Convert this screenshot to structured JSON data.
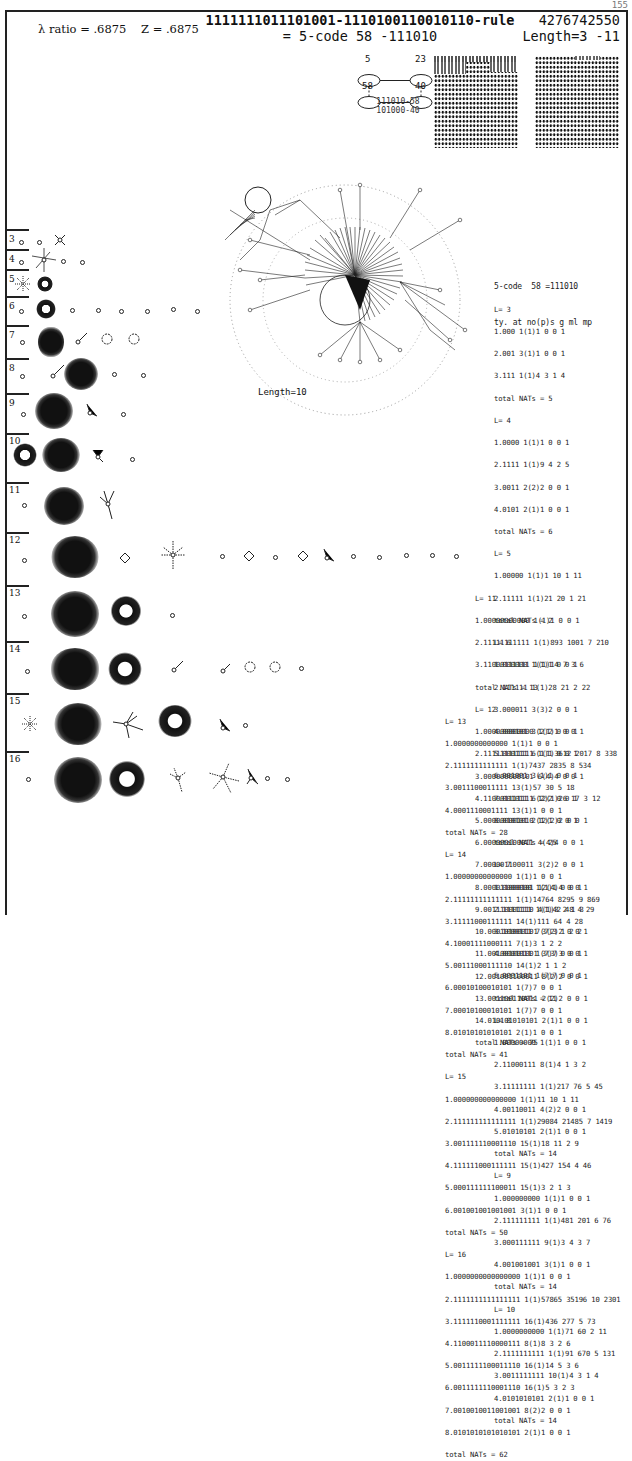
{
  "page_number": "155",
  "header": {
    "lambda_label": "λ ratio = .6875",
    "z_label": "Z = .6875",
    "rule_line": "1111111011101001-1110100110010110-rule",
    "code_line": "= 5-code  58 -111010",
    "rule_number": "4276742550",
    "length_range": "Length=3 -11"
  },
  "cycle_diagram": {
    "nodes": [
      "5",
      "23",
      "58",
      "40"
    ],
    "caption": [
      "111010-58",
      "101000-40"
    ]
  },
  "big_graph_label": "Length=10",
  "rows": [
    {
      "label": "3"
    },
    {
      "label": "4"
    },
    {
      "label": "5"
    },
    {
      "label": "6"
    },
    {
      "label": "7"
    },
    {
      "label": "8"
    },
    {
      "label": "9"
    },
    {
      "label": "10"
    },
    {
      "label": "11"
    },
    {
      "label": "12"
    },
    {
      "label": "13"
    },
    {
      "label": "14"
    },
    {
      "label": "15"
    },
    {
      "label": "16"
    }
  ],
  "stats": {
    "title": "5-code  58 =111010",
    "columns": "ty. at no(p)s g ml mp",
    "blocks": [
      {
        "L": "L= 3",
        "lines": [
          "1.000 1(1)1 0 0 1",
          "2.001 3(1)1 0 0 1",
          "3.111 1(1)4 3 1 4"
        ],
        "total": "total NATs = 5"
      },
      {
        "L": "L= 4",
        "lines": [
          "1.0000 1(1)1 0 0 1",
          "2.1111 1(1)9 4 2 5",
          "3.0011 2(2)2 0 0 1",
          "4.0101 2(1)1 0 0 1"
        ],
        "total": "total NATs = 6"
      },
      {
        "L": "L= 5",
        "lines": [
          "1.00000 1(1)1 10 1 11",
          "2.11111 1(1)21 20 1 21"
        ],
        "total": "total NATs = 2"
      },
      {
        "L": "L= 6",
        "lines": [
          "1.000000 1(1)1 0 0 1",
          "2.111111 1(1)28 21 2 22",
          "3.000011 3(3)2 0 0 1",
          "4.000101 3(2)2 0 0 1",
          "5.000111 6(1)1 0 0 1",
          "6.001001 3(1)1 0 0 1",
          "7.001011 6(2)2 0 0 1",
          "8.010101 2(1)1 0 0 1"
        ],
        "total": "total NATs = 25"
      },
      {
        "L": "L= 7",
        "lines": [
          "1.0000000 1(1)1 0 0 1",
          "2.1111111 1(1)42 48 4 29",
          "3.1000111 7(7)3 1 2 2",
          "4.0001011 1(7)7 0 0 1",
          "5.0001101 1(7)7 0 0 1"
        ],
        "total": "total NATs = 11"
      },
      {
        "L": "L= 8",
        "lines": [
          "1.00000000 1(1)1 0 0 1",
          "2.11000111 8(1)4 1 3 2",
          "3.11111111 1(1)217 76 5 45",
          "4.00110011 4(2)2 0 0 1",
          "5.01010101 2(1)1 0 0 1"
        ],
        "total": "total NATs = 14"
      },
      {
        "L": "L= 9",
        "lines": [
          "1.000000000 1(1)1 0 0 1",
          "2.111111111 1(1)481 201 6 76",
          "3.000111111 9(1)3 4 3 7",
          "4.001001001 3(1)1 0 0 1"
        ],
        "total": "total NATs = 14"
      },
      {
        "L": "L= 10",
        "lines": [
          "1.0000000000 1(1)71 60 2 11",
          "2.1111111111 1(1)91 670 5 131",
          "3.0011111111 10(1)4 3 1 4",
          "4.0101010101 2(1)1 0 0 1"
        ],
        "total": "total NATs = 14"
      },
      {
        "L": "L= 11",
        "lines": [
          "1.00000000000 1(1)1 0 0 1",
          "2.11111111111 1(1)893 1001 7 210",
          "3.11000111111 1(1)14 7 3 6"
        ],
        "total": "total NATs = 13"
      },
      {
        "L": "L= 12",
        "lines": [
          "1.000000000000 1(1)1 0 0 1",
          "2.111111111111 1(1)3612 2017 8 338",
          "3.000000000101 6(4)4 0 0 1",
          "4.110001111111 12(1)26 17 3 12",
          "5.000000001010 12(2)2 0 0 1",
          "6.000000100011 4(4)4 0 0 1",
          "7.000001100011 3(2)2 0 0 1",
          "8.000011000101 12(4)4 0 0 1",
          "9.001110001110 4(1)3 2 1 3",
          "10.000101000101 3(2)2 0 0 1",
          "11.001001001001 3(3)3 0 0 1",
          "12.001001100011 8(2)2 0 0 1",
          "13.001100110011 2(2)2 0 0 1",
          "14.010101010101 2(1)1 0 0 1"
        ],
        "total": "total NATs = 75"
      },
      {
        "L": "L= 13",
        "lines": [
          "1.0000000000000 1(1)1 0 0 1",
          "2.1111111111111 1(1)7437 2835 8 534",
          "3.0011100011111 13(1)57 30 5 18",
          "4.0001110001111 13(1)1 0 0 1"
        ],
        "total": "total NATs = 28"
      },
      {
        "L": "L= 14",
        "lines": [
          "1.00000000000000 1(1)1 0 0 1",
          "2.11111111111111 1(1)14764 8295 9 869",
          "3.11111000111111 14(1)111 64 4 28",
          "4.10001111000111 7(1)3 1 2 2",
          "5.00111000111110 14(1)2 1 1 2",
          "6.00010100010101 1(7)7 0 0 1",
          "7.00010100010101 1(7)7 0 0 1",
          "8.01010101010101 2(1)1 0 0 1"
        ],
        "total": "total NATs = 41"
      },
      {
        "L": "L= 15",
        "lines": [
          "1.000000000000000 1(1)11 10 1 11",
          "2.111111111111111 1(1)29084 21485 7 1419",
          "3.001111110001110 15(1)18 11 2 9",
          "4.111111000111111 15(1)427 154 4 46",
          "5.000111111100011 15(1)3 2 1 3",
          "6.001001001001001 3(1)1 0 0 1"
        ],
        "total": "total NATs = 50"
      },
      {
        "L": "L= 16",
        "lines": [
          "1.0000000000000000 1(1)1 0 0 1",
          "2.1111111111111111 1(1)57865 35196 10 2301",
          "3.1111110001111111 16(1)436 277 5 73",
          "4.1100011110000111 8(1)8 3 2 6",
          "5.0011111100011110 16(1)14 5 3 6",
          "6.0011111110001110 16(1)5 3 2 3",
          "7.0010010011001001 8(2)2 0 0 1",
          "8.0101010101010101 2(1)1 0 0 1"
        ],
        "total": "total NATs = 62"
      }
    ]
  }
}
